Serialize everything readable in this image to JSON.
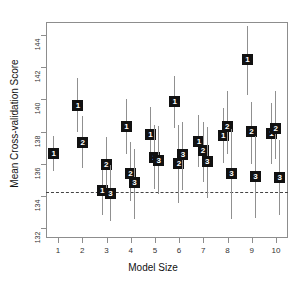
{
  "chart_data": {
    "type": "scatter",
    "title": "",
    "xlabel": "Model Size",
    "ylabel": "Mean Cross-validation Score",
    "xlim": [
      0.5,
      10.5
    ],
    "ylim": [
      131.4,
      144.8
    ],
    "grid": false,
    "legend": null,
    "xticks": [
      1,
      2,
      3,
      4,
      5,
      6,
      7,
      8,
      9,
      10
    ],
    "xtick_labels": [
      "1",
      "2",
      "3",
      "4",
      "5",
      "6",
      "7",
      "8",
      "9",
      "10"
    ],
    "yticks": [
      132,
      134,
      136,
      138,
      140,
      142,
      144
    ],
    "ytick_labels": [
      "132",
      "134",
      "136",
      "138",
      "140",
      "142",
      "144"
    ],
    "reference_line": {
      "y": 134.25,
      "style": "dotted",
      "color": "#444444"
    },
    "marker_style": "filled-square-with-number",
    "series": [
      {
        "name": "1",
        "label": "1"
      },
      {
        "name": "2",
        "label": "2"
      },
      {
        "name": "3",
        "label": "3"
      }
    ],
    "points": [
      {
        "model_size": 1,
        "series": "1",
        "x": 0.8,
        "y": 136.62,
        "lo": 135.55,
        "hi": 137.72
      },
      {
        "model_size": 2,
        "series": "1",
        "x": 1.8,
        "y": 139.62,
        "lo": 137.95,
        "hi": 141.3
      },
      {
        "model_size": 2,
        "series": "2",
        "x": 2.0,
        "y": 137.35,
        "lo": 135.75,
        "hi": 138.95
      },
      {
        "model_size": 3,
        "series": "1",
        "x": 2.8,
        "y": 134.35,
        "lo": 132.85,
        "hi": 136.0
      },
      {
        "model_size": 3,
        "series": "2",
        "x": 2.97,
        "y": 135.95,
        "lo": 134.3,
        "hi": 137.65
      },
      {
        "model_size": 3,
        "series": "3",
        "x": 3.14,
        "y": 134.18,
        "lo": 132.45,
        "hi": 135.9
      },
      {
        "model_size": 4,
        "series": "1",
        "x": 3.8,
        "y": 138.3,
        "lo": 136.6,
        "hi": 140.0
      },
      {
        "model_size": 4,
        "series": "2",
        "x": 3.97,
        "y": 135.38,
        "lo": 133.7,
        "hi": 137.35
      },
      {
        "model_size": 4,
        "series": "3",
        "x": 4.14,
        "y": 134.85,
        "lo": 132.6,
        "hi": 136.95
      },
      {
        "model_size": 5,
        "series": "1",
        "x": 4.8,
        "y": 137.85,
        "lo": 136.35,
        "hi": 139.5
      },
      {
        "model_size": 5,
        "series": "2",
        "x": 4.97,
        "y": 136.4,
        "lo": 134.45,
        "hi": 138.4
      },
      {
        "model_size": 5,
        "series": "3",
        "x": 5.14,
        "y": 136.2,
        "lo": 134.1,
        "hi": 138.35
      },
      {
        "model_size": 6,
        "series": "1",
        "x": 5.8,
        "y": 139.85,
        "lo": 138.25,
        "hi": 141.45
      },
      {
        "model_size": 6,
        "series": "2",
        "x": 5.97,
        "y": 136.05,
        "lo": 133.55,
        "hi": 138.4
      },
      {
        "model_size": 6,
        "series": "3",
        "x": 6.14,
        "y": 136.6,
        "lo": 134.4,
        "hi": 138.6
      },
      {
        "model_size": 7,
        "series": "1",
        "x": 6.8,
        "y": 137.4,
        "lo": 135.8,
        "hi": 139.0
      },
      {
        "model_size": 7,
        "series": "2",
        "x": 6.97,
        "y": 136.8,
        "lo": 134.85,
        "hi": 138.6
      },
      {
        "model_size": 7,
        "series": "3",
        "x": 7.14,
        "y": 136.15,
        "lo": 133.85,
        "hi": 138.3
      },
      {
        "model_size": 8,
        "series": "1",
        "x": 7.8,
        "y": 137.75,
        "lo": 136.05,
        "hi": 139.45
      },
      {
        "model_size": 8,
        "series": "2",
        "x": 7.97,
        "y": 138.3,
        "lo": 136.6,
        "hi": 140.5
      },
      {
        "model_size": 8,
        "series": "3",
        "x": 8.14,
        "y": 135.4,
        "lo": 132.55,
        "hi": 138.15
      },
      {
        "model_size": 9,
        "series": "1",
        "x": 8.8,
        "y": 142.45,
        "lo": 140.25,
        "hi": 144.55
      },
      {
        "model_size": 9,
        "series": "2",
        "x": 8.97,
        "y": 138.0,
        "lo": 136.0,
        "hi": 139.85
      },
      {
        "model_size": 9,
        "series": "3",
        "x": 9.14,
        "y": 135.2,
        "lo": 132.65,
        "hi": 137.7
      },
      {
        "model_size": 10,
        "series": "1",
        "x": 9.8,
        "y": 137.9,
        "lo": 136.0,
        "hi": 139.8
      },
      {
        "model_size": 10,
        "series": "2",
        "x": 9.97,
        "y": 138.2,
        "lo": 136.3,
        "hi": 140.55
      },
      {
        "model_size": 10,
        "series": "3",
        "x": 10.14,
        "y": 135.15,
        "lo": 132.8,
        "hi": 137.5
      }
    ]
  }
}
